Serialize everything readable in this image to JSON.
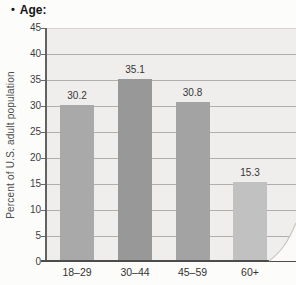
{
  "header": {
    "bullet": "•",
    "title": "Age:"
  },
  "chart_data": {
    "type": "bar",
    "title": "Age:",
    "categories": [
      "18–29",
      "30–44",
      "45–59",
      "60+"
    ],
    "values": [
      30.2,
      35.1,
      30.8,
      15.3
    ],
    "value_labels": [
      "30.2",
      "35.1",
      "30.8",
      "15.3"
    ],
    "xlabel": "",
    "ylabel": "Percent of U.S. adult population",
    "ylim": [
      0,
      45
    ],
    "yticks": [
      0,
      5,
      10,
      15,
      20,
      25,
      30,
      35,
      40,
      45
    ],
    "grid": true,
    "legend": false,
    "bar_colors": [
      "#a9a9a9",
      "#989898",
      "#a3a3a3",
      "#c1c1c1"
    ],
    "colors": {
      "plot_background": "#efeeec",
      "gridline": "#b2afaa",
      "top_gridline": "#d6d4d0",
      "axis": "#626262",
      "baseline": "#4c4c4c",
      "text": "#3d3d3d"
    }
  }
}
